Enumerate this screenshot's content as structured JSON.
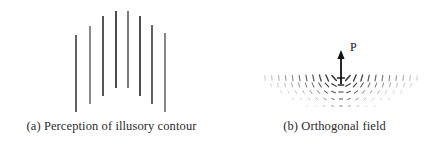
{
  "figure": {
    "background": "#ffffff",
    "width": 438,
    "height": 151,
    "ink_color": "#1a1a1a",
    "caption_color": "#2b2b2b"
  },
  "panel_a": {
    "caption": "(a) Perception of illusory contour",
    "description": "Array of eight vertical line segments whose endpoints trace an illusory arch",
    "line_color": "#262626",
    "line_width": 1.6,
    "lines": [
      {
        "x": 76,
        "y1": 35,
        "y2": 112,
        "shade": "#3a3a3a"
      },
      {
        "x": 90,
        "y1": 26,
        "y2": 104,
        "shade": "#6e6e6e"
      },
      {
        "x": 103,
        "y1": 16,
        "y2": 96,
        "shade": "#2b2b2b"
      },
      {
        "x": 116,
        "y1": 11,
        "y2": 88,
        "shade": "#1e1e1e"
      },
      {
        "x": 128,
        "y1": 11,
        "y2": 88,
        "shade": "#5a5a5a"
      },
      {
        "x": 140,
        "y1": 16,
        "y2": 96,
        "shade": "#232323"
      },
      {
        "x": 152,
        "y1": 25,
        "y2": 104,
        "shade": "#3a3a3a"
      },
      {
        "x": 165,
        "y1": 33,
        "y2": 112,
        "shade": "#6a6a6a"
      }
    ]
  },
  "panel_b": {
    "caption": "(b) Orthogonal field",
    "description": "Field of short oriented tick marks splaying outward from a central point source",
    "arrow_label": "P",
    "arrow": {
      "x": 122,
      "y_tail": 84,
      "y_head": 50,
      "color": "#111111"
    },
    "tick_color": "#1f1f1f",
    "field_center_x": 122,
    "field_top_y": 76,
    "rows": [
      {
        "y": 78,
        "half_span": 76,
        "count": 23,
        "tick_len": 7.0
      },
      {
        "y": 85,
        "half_span": 70,
        "count": 21,
        "tick_len": 5.4
      },
      {
        "y": 92,
        "half_span": 60,
        "count": 17,
        "tick_len": 4.2
      },
      {
        "y": 99,
        "half_span": 48,
        "count": 13,
        "tick_len": 3.2
      },
      {
        "y": 106,
        "half_span": 34,
        "count": 9,
        "tick_len": 2.4
      }
    ]
  },
  "chart_data": {
    "type": "scatter",
    "title": "",
    "panels": [
      {
        "label": "(a)",
        "caption": "(a) Perception of illusory contour",
        "type": "line-array",
        "x": [
          76,
          90,
          103,
          116,
          128,
          140,
          152,
          165
        ],
        "y_top": [
          35,
          26,
          16,
          11,
          11,
          16,
          25,
          33
        ],
        "y_bottom": [
          112,
          104,
          96,
          88,
          88,
          96,
          104,
          112
        ]
      },
      {
        "label": "(b)",
        "caption": "(b) Orthogonal field",
        "type": "vector-field",
        "annotations": [
          "P"
        ],
        "row_y": [
          78,
          85,
          92,
          99,
          106
        ],
        "row_half_span": [
          76,
          70,
          60,
          48,
          34
        ],
        "row_count": [
          23,
          21,
          17,
          13,
          9
        ]
      }
    ]
  }
}
